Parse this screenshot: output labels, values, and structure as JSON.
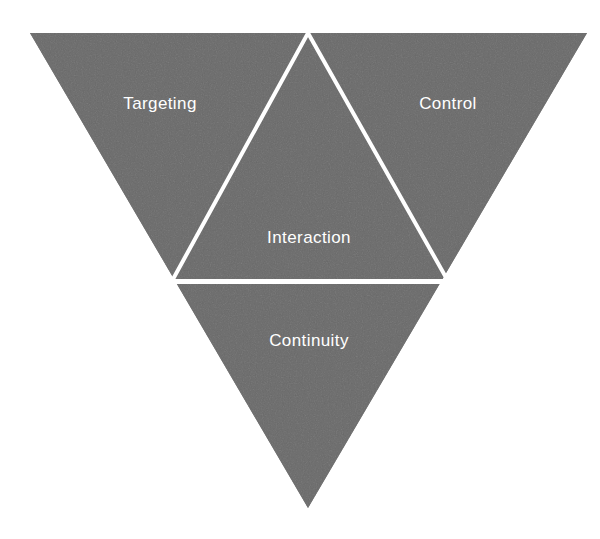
{
  "diagram": {
    "type": "inverted-triangle-framework",
    "background_color": "#ffffff",
    "fill_color": "#6a6a6a",
    "stroke_color": "#ffffff",
    "text_color": "#ffffff",
    "segments": [
      {
        "id": "targeting",
        "label": "Targeting",
        "position": "top-left"
      },
      {
        "id": "control",
        "label": "Control",
        "position": "top-right"
      },
      {
        "id": "interaction",
        "label": "Interaction",
        "position": "center"
      },
      {
        "id": "continuity",
        "label": "Continuity",
        "position": "bottom"
      }
    ],
    "geometry": {
      "outer_triangle": [
        [
          30,
          33
        ],
        [
          587,
          33
        ],
        [
          308,
          508
        ]
      ],
      "inner_triangle": [
        [
          308,
          33
        ],
        [
          448,
          281
        ],
        [
          172,
          281
        ]
      ],
      "divider_line": [
        [
          172,
          282
        ],
        [
          448,
          282
        ]
      ],
      "stroke_width": 4
    }
  }
}
